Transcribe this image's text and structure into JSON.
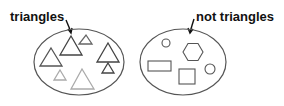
{
  "groups": [
    {
      "label": "triangles",
      "shapes": [
        {
          "type": "triangle",
          "apex": [
            51,
            48
          ],
          "base_y": 66,
          "base_x": [
            40,
            62
          ],
          "stroke": "#555555"
        },
        {
          "type": "triangle",
          "apex": [
            71,
            36
          ],
          "base_y": 55,
          "base_x": [
            60,
            82
          ],
          "stroke": "#444444"
        },
        {
          "type": "triangle",
          "apex": [
            86,
            35
          ],
          "base_y": 44,
          "base_x": [
            79,
            92
          ],
          "stroke": "#666666"
        },
        {
          "type": "triangle",
          "apex": [
            108,
            43
          ],
          "base_y": 62,
          "base_x": [
            97,
            119
          ],
          "stroke": "#444444"
        },
        {
          "type": "triangle",
          "apex": [
            108,
            63
          ],
          "base_y": 73,
          "base_x": [
            102,
            114
          ],
          "stroke": "#444444"
        },
        {
          "type": "triangle",
          "apex": [
            60,
            70
          ],
          "base_y": 80,
          "base_x": [
            54,
            66
          ],
          "stroke": "#aaaaaa"
        },
        {
          "type": "triangle",
          "apex": [
            82,
            69
          ],
          "base_y": 89,
          "base_x": [
            71,
            94
          ],
          "stroke": "#aaaaaa"
        }
      ]
    },
    {
      "label": "not triangles",
      "shapes": [
        {
          "type": "circle",
          "center": [
            166,
            43
          ],
          "r": 4
        },
        {
          "type": "hexagon",
          "center": [
            193,
            52
          ],
          "r": 10
        },
        {
          "type": "rectangle",
          "x": 148,
          "y": 61,
          "w": 23,
          "h": 10
        },
        {
          "type": "square",
          "x": 179,
          "y": 69,
          "w": 16,
          "h": 15
        },
        {
          "type": "circle",
          "center": [
            210,
            69
          ],
          "r": 5
        }
      ]
    }
  ],
  "colors": {
    "outline": "#555555",
    "text": "#111111",
    "background": "#ffffff"
  }
}
